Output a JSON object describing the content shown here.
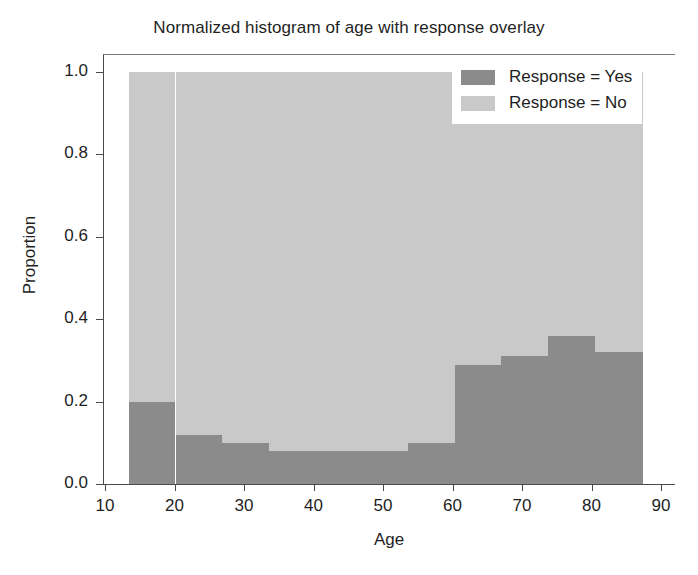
{
  "chart_data": {
    "type": "bar",
    "title": "Normalized histogram of age with response overlay",
    "xlabel": "Age",
    "ylabel": "Proportion",
    "xlim": [
      10,
      90
    ],
    "ylim": [
      0.0,
      1.0
    ],
    "xticks": [
      10,
      20,
      30,
      40,
      50,
      60,
      70,
      80,
      90
    ],
    "yticks": [
      "0.0",
      "0.2",
      "0.4",
      "0.6",
      "0.8",
      "1.0"
    ],
    "grid": false,
    "stacked": true,
    "normalized": true,
    "bin_edges": [
      13.3,
      20.0,
      26.7,
      33.4,
      40.1,
      46.8,
      53.5,
      60.2,
      66.9,
      73.6,
      80.3,
      87.3
    ],
    "bin_centers": [
      16.6,
      23.3,
      30.0,
      36.7,
      43.4,
      50.1,
      56.8,
      63.5,
      70.2,
      76.9,
      83.8
    ],
    "series": [
      {
        "name": "Response = Yes",
        "color": "#8b8b8b",
        "values": [
          0.2,
          0.12,
          0.1,
          0.08,
          0.08,
          0.08,
          0.1,
          0.29,
          0.31,
          0.36,
          0.32
        ]
      },
      {
        "name": "Response = No",
        "color": "#c9c9c9",
        "values": [
          0.8,
          0.88,
          0.9,
          0.92,
          0.92,
          0.92,
          0.9,
          0.71,
          0.69,
          0.64,
          0.68
        ]
      }
    ],
    "legend": {
      "position": "upper right",
      "entries": [
        {
          "label": "Response = Yes",
          "color": "#8b8b8b"
        },
        {
          "label": "Response = No",
          "color": "#c9c9c9"
        }
      ]
    }
  }
}
